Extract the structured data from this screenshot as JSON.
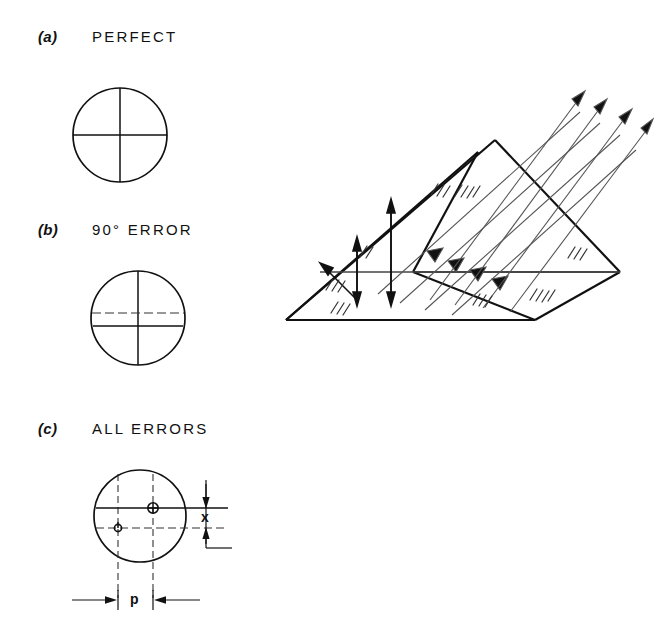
{
  "figure": {
    "kind": "optics-diagram",
    "ink_color": "#111111",
    "dash_color": "#333333",
    "background": "#ffffff"
  },
  "panels": [
    {
      "index": "(a)",
      "title": "PERFECT"
    },
    {
      "index": "(b)",
      "title": "90° ERROR"
    },
    {
      "index": "(c)",
      "title": "ALL ERRORS"
    }
  ],
  "dimensions": [
    {
      "name": "x",
      "label": "x",
      "orientation": "vertical"
    },
    {
      "name": "p",
      "label": "p",
      "orientation": "horizontal"
    }
  ],
  "prism": {
    "name": "trihedral-corner-cube-prism",
    "incoming_rays": 4,
    "outgoing_rays": 4,
    "internal_reflections": 3,
    "hatch_groups": 8
  }
}
